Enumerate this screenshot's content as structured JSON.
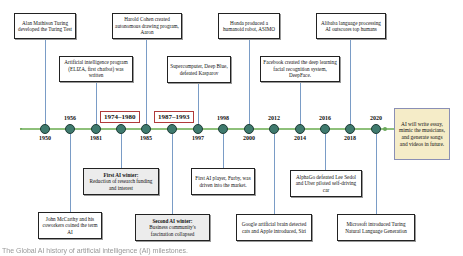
{
  "timeline": {
    "colors": {
      "line": "#8ec07a",
      "node": "#3f7a6e",
      "connector": "#7a9cc6",
      "period_border": "#b03a3a",
      "future_box_bg": "#f5ecc8"
    },
    "nodes": [
      {
        "year": "1950",
        "label_pos": "below"
      },
      {
        "year": "1956",
        "label_pos": "above"
      },
      {
        "year": "1981",
        "label_pos": "below"
      },
      {
        "year": "",
        "label_pos": "none"
      },
      {
        "year": "1985",
        "label_pos": "below"
      },
      {
        "year": "",
        "label_pos": "none"
      },
      {
        "year": "1997",
        "label_pos": "below"
      },
      {
        "year": "1998",
        "label_pos": "above"
      },
      {
        "year": "2000",
        "label_pos": "below"
      },
      {
        "year": "2012",
        "label_pos": "above"
      },
      {
        "year": "2014",
        "label_pos": "below"
      },
      {
        "year": "2016",
        "label_pos": "above"
      },
      {
        "year": "2018",
        "label_pos": "below"
      },
      {
        "year": "2020",
        "label_pos": "above"
      }
    ],
    "periods": [
      {
        "label": "1974–1980"
      },
      {
        "label": "1987–1993"
      }
    ]
  },
  "events_top": [
    {
      "text": "Alan Mathison Turing developed the Turing Test"
    },
    {
      "text": "Artificial intelligence program (ELIZA, first chatbot) was written"
    },
    {
      "text": "Harold Cohen created autonomous drawing program, Aaron"
    },
    {
      "text": "Supercomputer, Deep Blue, defeated Kasparov"
    },
    {
      "text": "Honda produced a humanoid robot, ASIMO"
    },
    {
      "text": "Facebook created the  deep learning facial recognition system, DeepFace."
    },
    {
      "text": "Alibaba language processing AI outscores top humans"
    }
  ],
  "events_bottom": [
    {
      "title": "First AI winter:",
      "text": "Reduction of research funding and interest"
    },
    {
      "text": "First AI player, Furby, was driven into the market."
    },
    {
      "text": "AlphaGo defeated Lee Sedol and Uber piloted self-driving car"
    },
    {
      "text": "John McCarthy and his coworkers coined the term AI"
    },
    {
      "title": "Second AI winter:",
      "text": "Business community's fascination collapsed"
    },
    {
      "text": "Google artificial brain detected cats and Apple introduced, Siri"
    },
    {
      "text": "Microsoft introduced Turing Natural Language Generation"
    }
  ],
  "future": {
    "text": "AI will write essay, mimic the musicians, and generate songs and videos in future."
  },
  "caption": {
    "text": "The Global AI history of artificial intelligence (AI) milestones."
  }
}
